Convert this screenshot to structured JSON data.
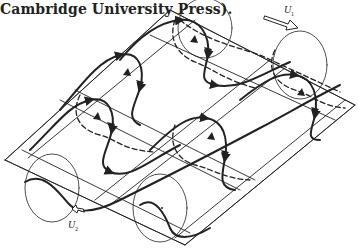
{
  "caption": {
    "text": "Cambridge University Press)."
  },
  "figure": {
    "labels": {
      "upper_velocity": {
        "symbol": "U",
        "subscript": "1"
      },
      "lower_velocity": {
        "symbol": "U",
        "subscript": "2"
      }
    },
    "colors": {
      "ink": "#222222",
      "background": "#ffffff"
    }
  }
}
